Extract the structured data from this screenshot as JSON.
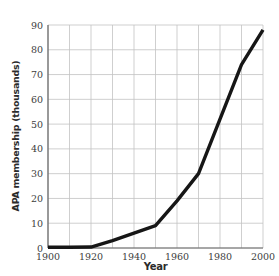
{
  "chart_data": {
    "type": "line",
    "title": "",
    "xlabel": "Year",
    "ylabel": "APA membership (thousands)",
    "series": [
      {
        "name": "APA membership (thousands)",
        "x": [
          1900,
          1910,
          1920,
          1930,
          1940,
          1950,
          1960,
          1970,
          1980,
          1990,
          2000
        ],
        "values": [
          0.3,
          0.3,
          0.4,
          3,
          6,
          9,
          19,
          30,
          52,
          74,
          88
        ]
      }
    ],
    "xlim": [
      1900,
      2000
    ],
    "ylim": [
      0,
      90
    ],
    "x_ticks": [
      1900,
      1920,
      1940,
      1960,
      1980,
      2000
    ],
    "y_ticks": [
      0,
      10,
      20,
      30,
      40,
      50,
      60,
      70,
      80,
      90
    ],
    "x_grid_step": 10,
    "y_grid_step": 10,
    "grid": true,
    "legend": "none",
    "line_color": "#161616",
    "line_width": 3.4,
    "grid_color": "#c3c3c3",
    "axis_color": "#666666",
    "tick_label_color": "#3d3d3d"
  }
}
